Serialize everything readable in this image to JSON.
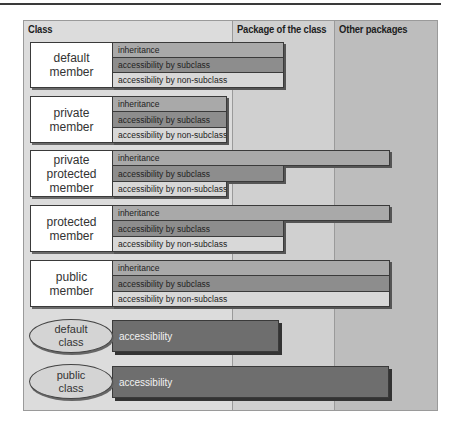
{
  "columns": [
    {
      "label": "Class"
    },
    {
      "label": "Package of the class"
    },
    {
      "label": "Other packages"
    }
  ],
  "colors": {
    "class_column": "#dcdcdc",
    "package_column": "#d0d0d0",
    "other_packages_column": "#bdbdbd",
    "inheritance": "#a9a9a9",
    "accessibility_by_subclass": "#8d8d8d",
    "accessibility_by_non_subclass": "#d8d8d8",
    "class_accessibility": "#6e6e6e"
  },
  "members": [
    {
      "label": "default\nmember",
      "rows": [
        {
          "label": "inheritance",
          "extent": "Package of the class"
        },
        {
          "label": "accessibility by subclass",
          "extent": "Package of the class"
        },
        {
          "label": "accessibility by non-subclass",
          "extent": "Package of the class"
        }
      ]
    },
    {
      "label": "private\nmember",
      "rows": [
        {
          "label": "inheritance",
          "extent": "Class"
        },
        {
          "label": "accessibility by subclass",
          "extent": "Class"
        },
        {
          "label": "accessibility by non-subclass",
          "extent": "Class"
        }
      ]
    },
    {
      "label": "private\nprotected\nmember",
      "rows": [
        {
          "label": "inheritance",
          "extent": "Other packages"
        },
        {
          "label": "accessibility by subclass",
          "extent": "Package of the class"
        },
        {
          "label": "accessibility by non-subclass",
          "extent": "Class"
        }
      ]
    },
    {
      "label": "protected\nmember",
      "rows": [
        {
          "label": "inheritance",
          "extent": "Other packages"
        },
        {
          "label": "accessibility by subclass",
          "extent": "Package of the class"
        },
        {
          "label": "accessibility by non-subclass",
          "extent": "Package of the class"
        }
      ]
    },
    {
      "label": "public\nmember",
      "rows": [
        {
          "label": "inheritance",
          "extent": "Other packages"
        },
        {
          "label": "accessibility by subclass",
          "extent": "Other packages"
        },
        {
          "label": "accessibility by non-subclass",
          "extent": "Other packages"
        }
      ]
    }
  ],
  "classes": [
    {
      "label": "default\nclass",
      "bar_label": "accessibility",
      "extent": "Package of the class"
    },
    {
      "label": "public\nclass",
      "bar_label": "accessibility",
      "extent": "Other packages"
    }
  ]
}
